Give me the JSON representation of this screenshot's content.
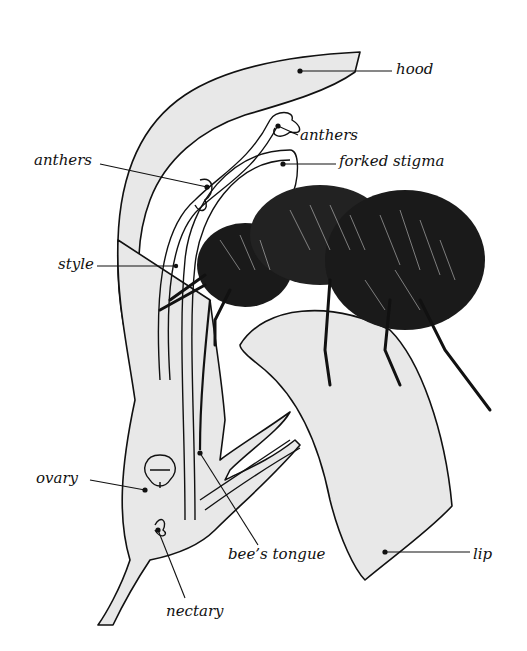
{
  "diagram": {
    "title": "",
    "colors": {
      "petal_fill": "#e8e8e8",
      "ink": "#111111",
      "background": "#ffffff"
    },
    "labels": [
      {
        "id": "hood",
        "text": "hood",
        "x": 396,
        "y": 62
      },
      {
        "id": "anthers-upper",
        "text": "anthers",
        "x": 300,
        "y": 128
      },
      {
        "id": "anthers-left",
        "text": "anthers",
        "x": 34,
        "y": 153
      },
      {
        "id": "forked-stigma",
        "text": "forked stigma",
        "x": 339,
        "y": 154
      },
      {
        "id": "style",
        "text": "style",
        "x": 58,
        "y": 257
      },
      {
        "id": "ovary",
        "text": "ovary",
        "x": 36,
        "y": 471
      },
      {
        "id": "bees-tongue",
        "text": "bee’s tongue",
        "x": 228,
        "y": 547
      },
      {
        "id": "lip",
        "text": "lip",
        "x": 473,
        "y": 547
      },
      {
        "id": "nectary",
        "text": "nectary",
        "x": 166,
        "y": 604
      }
    ]
  }
}
